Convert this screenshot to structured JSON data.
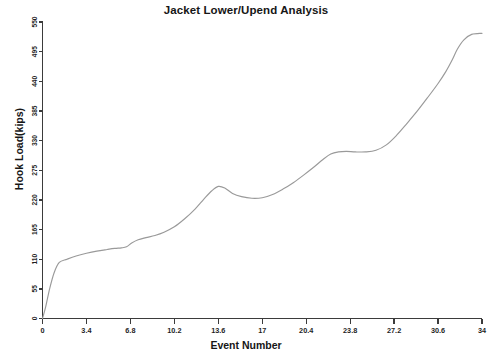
{
  "chart_data": {
    "type": "line",
    "title": "Jacket Lower/Upend Analysis",
    "xlabel": "Event Number",
    "ylabel": "Hook Load(kips)",
    "xlim": [
      0,
      34
    ],
    "ylim": [
      0,
      550
    ],
    "xticks": [
      "0",
      "3.4",
      "6.8",
      "10.2",
      "13.6",
      "17",
      "20.4",
      "23.8",
      "27.2",
      "30.6",
      "34"
    ],
    "xtick_values": [
      0,
      3.4,
      6.8,
      10.2,
      13.6,
      17,
      20.4,
      23.8,
      27.2,
      30.6,
      34
    ],
    "yticks": [
      "0",
      "55",
      "110",
      "165",
      "220",
      "275",
      "330",
      "385",
      "440",
      "495",
      "550"
    ],
    "ytick_values": [
      0,
      55,
      110,
      165,
      220,
      275,
      330,
      385,
      440,
      495,
      550
    ],
    "grid": false,
    "legend": false,
    "legend_position": "none",
    "line_color": "#9a9a9a",
    "axis_color": "#3b3b3b",
    "background_color": "#ffffff",
    "series": [
      {
        "name": "Hook Load",
        "x": [
          0.0,
          0.25,
          0.55,
          0.9,
          1.3,
          1.9,
          2.6,
          3.4,
          4.2,
          5.0,
          5.6,
          6.1,
          6.5,
          6.9,
          7.4,
          8.0,
          8.7,
          9.4,
          10.2,
          11.0,
          11.8,
          12.5,
          13.1,
          13.6,
          14.1,
          14.7,
          15.4,
          16.2,
          17.0,
          17.8,
          18.6,
          19.4,
          20.2,
          21.0,
          21.7,
          22.3,
          22.9,
          23.5,
          24.2,
          25.0,
          25.8,
          26.6,
          27.4,
          28.2,
          29.0,
          29.8,
          30.6,
          31.2,
          31.7,
          32.1,
          32.6,
          33.2,
          34.0
        ],
        "y": [
          0,
          22,
          55,
          85,
          104,
          110,
          116,
          121,
          125,
          128,
          130,
          131,
          133,
          140,
          146,
          150,
          154,
          160,
          170,
          185,
          203,
          222,
          237,
          245,
          242,
          232,
          226,
          223,
          224,
          230,
          240,
          252,
          266,
          281,
          295,
          305,
          309,
          310,
          309,
          309,
          312,
          322,
          340,
          362,
          385,
          410,
          436,
          458,
          480,
          500,
          517,
          527,
          529
        ]
      }
    ]
  }
}
